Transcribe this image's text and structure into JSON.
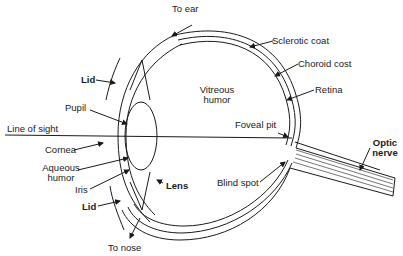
{
  "diagram": {
    "type": "anatomical cross-section",
    "labels": {
      "to_ear": "To ear",
      "sclerotic_coat": "Sclerotic coat",
      "choroid_coat": "Choroid cost",
      "retina": "Retina",
      "lid_top": "Lid",
      "pupil": "Pupil",
      "vitreous_humor_1": "Vitreous",
      "vitreous_humor_2": "humor",
      "line_of_sight": "Line of sight",
      "foveal_pit": "Foveal pit",
      "cornea": "Cornea",
      "aqueous_humor_1": "Aqueous",
      "aqueous_humor_2": "humor",
      "lens": "Lens",
      "iris": "Iris",
      "lid_bottom": "Lid",
      "blind_spot": "Blind spot",
      "optic_nerve_1": "Optic",
      "optic_nerve_2": "nerve",
      "to_nose": "To nose"
    },
    "colors": {
      "line": "#1a1a1a",
      "background": "#ffffff"
    }
  }
}
